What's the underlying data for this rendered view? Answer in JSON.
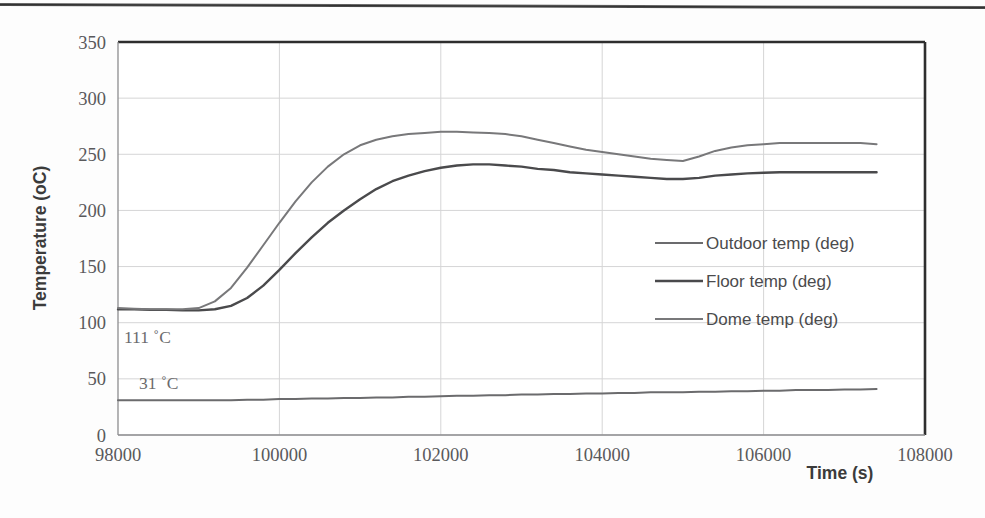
{
  "figure": {
    "background_color": "#fdfdfd",
    "page_rule_color": "#262626",
    "plot_border_color": "#3a3a3a",
    "grid_color": "#d5d5d6"
  },
  "chart_data": {
    "type": "line",
    "title": "",
    "subtitle": "",
    "xlabel": "Time (s)",
    "ylabel": "Temperature (oC)",
    "xlim": [
      98000,
      108000
    ],
    "ylim": [
      0,
      350
    ],
    "xticks": [
      "98000",
      "100000",
      "102000",
      "104000",
      "106000",
      "108000"
    ],
    "xtick_values": [
      98000,
      100000,
      102000,
      104000,
      106000,
      108000
    ],
    "yticks": [
      "0",
      "50",
      "100",
      "150",
      "200",
      "250",
      "300",
      "350"
    ],
    "ytick_values": [
      0,
      50,
      100,
      150,
      200,
      250,
      300,
      350
    ],
    "grid": "horizontal-and-vertical",
    "legend_position": "center-right-inside",
    "x": [
      98000,
      98200,
      98400,
      98600,
      98800,
      99000,
      99200,
      99400,
      99600,
      99800,
      100000,
      100200,
      100400,
      100600,
      100800,
      101000,
      101200,
      101400,
      101600,
      101800,
      102000,
      102200,
      102400,
      102600,
      102800,
      103000,
      103200,
      103400,
      103600,
      103800,
      104000,
      104200,
      104400,
      104600,
      104800,
      105000,
      105200,
      105400,
      105600,
      105800,
      106000,
      106200,
      106400,
      106600,
      106800,
      107000,
      107200,
      107400
    ],
    "series": [
      {
        "name": "Outdoor temp (deg)",
        "color": "#6b6b6d",
        "width": 2.0,
        "values": [
          31,
          31,
          31,
          31,
          31,
          31,
          31,
          31,
          31.5,
          31.5,
          32,
          32,
          32.5,
          32.5,
          33,
          33,
          33.5,
          33.5,
          34,
          34,
          34.5,
          35,
          35,
          35.5,
          35.5,
          36,
          36,
          36.5,
          36.5,
          37,
          37,
          37.5,
          37.5,
          38,
          38,
          38,
          38.5,
          38.5,
          39,
          39,
          39.5,
          39.5,
          40,
          40,
          40,
          40.5,
          40.5,
          41
        ]
      },
      {
        "name": "Floor temp (deg)",
        "color": "#4a4a4c",
        "width": 2.4,
        "values": [
          112,
          112,
          111.5,
          111.5,
          111,
          111,
          112,
          115,
          122,
          133,
          147,
          162,
          176,
          189,
          200,
          210,
          219,
          226,
          231,
          235,
          238,
          240,
          241,
          241,
          240,
          239,
          237,
          236,
          234,
          233,
          232,
          231,
          230,
          229,
          228,
          228,
          229,
          231,
          232,
          233,
          233.5,
          234,
          234,
          234,
          234,
          234,
          234,
          234
        ]
      },
      {
        "name": "Dome temp (deg)",
        "color": "#78787a",
        "width": 2.0,
        "values": [
          113,
          112.5,
          112,
          112,
          112,
          113,
          119,
          131,
          149,
          169,
          189,
          208,
          225,
          239,
          250,
          258,
          263,
          266,
          268,
          269,
          270,
          270,
          269.5,
          269,
          268,
          266,
          263,
          260,
          257,
          254,
          252,
          250,
          248,
          246,
          245,
          244,
          248,
          253,
          256,
          258,
          259,
          260,
          260,
          260,
          260,
          260,
          260,
          259
        ]
      }
    ],
    "annotations": [
      {
        "text": "111 ˚C",
        "x": 98000,
        "y": 93,
        "pixel_x": 124,
        "pixel_y": 343
      },
      {
        "text": "31 ˚C",
        "x": 98180,
        "y": 52,
        "pixel_x": 139,
        "pixel_y": 389
      }
    ],
    "legend": [
      {
        "label": "Outdoor temp (deg)",
        "color": "#6b6b6d"
      },
      {
        "label": "Floor temp (deg)",
        "color": "#4a4a4c"
      },
      {
        "label": "Dome temp (deg)",
        "color": "#78787a"
      }
    ]
  }
}
